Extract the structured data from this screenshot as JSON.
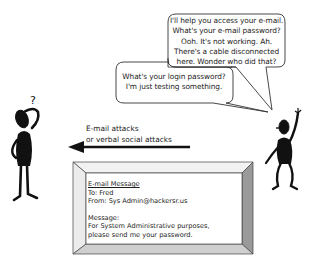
{
  "diagram": {
    "left_figure": {
      "label": "confused victim",
      "symbol": "?"
    },
    "right_figure": {
      "label": "attacker waving"
    },
    "bubble_attacker": {
      "lines": [
        "I'll help you access your e-mail.",
        "What's your e-mail password?",
        "Ooh. It's not working. Ah.",
        "There's a cable disconnected",
        "here. Wonder who did that?"
      ]
    },
    "bubble_login": {
      "lines": [
        "What's your login password?",
        "I'm just testing something."
      ]
    },
    "arrow": {
      "direction": "left",
      "label_lines": [
        "E-mail attacks",
        "or verbal social attacks"
      ]
    },
    "email": {
      "title": "E-mail Message",
      "to": "To: Fred",
      "from": "From: Sys Admin@hackersr.us",
      "message_label": "Message:",
      "body_lines": [
        "For System Administrative purposes,",
        "please send me your password."
      ]
    },
    "colors": {
      "ink": "#111111",
      "frame_light": "#e8e8e8",
      "frame_mid": "#cfcfcf",
      "frame_dark": "#9a9a9a"
    }
  }
}
